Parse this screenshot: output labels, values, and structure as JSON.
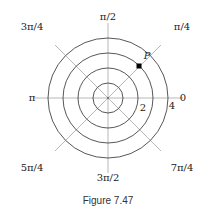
{
  "diagram": {
    "type": "polar-grid",
    "center": [
      108,
      98
    ],
    "circle_radii_px": [
      15,
      30,
      45,
      60
    ],
    "ray_length_px": 75,
    "colors": {
      "circle": "#444444",
      "ray": "#b0b0b0",
      "point": "#000000"
    },
    "angle_labels": [
      {
        "text": "0",
        "x": 183,
        "y": 101
      },
      {
        "text": "π/4",
        "x": 182,
        "y": 30
      },
      {
        "text": "π/2",
        "x": 108,
        "y": 20
      },
      {
        "text": "3π/4",
        "x": 32,
        "y": 30
      },
      {
        "text": "π",
        "x": 32,
        "y": 101
      },
      {
        "text": "5π/4",
        "x": 32,
        "y": 171
      },
      {
        "text": "3π/2",
        "x": 108,
        "y": 181
      },
      {
        "text": "7π/4",
        "x": 182,
        "y": 171
      }
    ],
    "radius_labels": [
      {
        "text": "2",
        "x": 143,
        "y": 111
      },
      {
        "text": "4",
        "x": 172,
        "y": 109
      }
    ],
    "point": {
      "label": "P",
      "r_circle_index": 3,
      "angle": "π/4",
      "x": 139,
      "y": 66,
      "label_x": 147,
      "label_y": 59
    }
  },
  "caption": "Figure 7.47"
}
